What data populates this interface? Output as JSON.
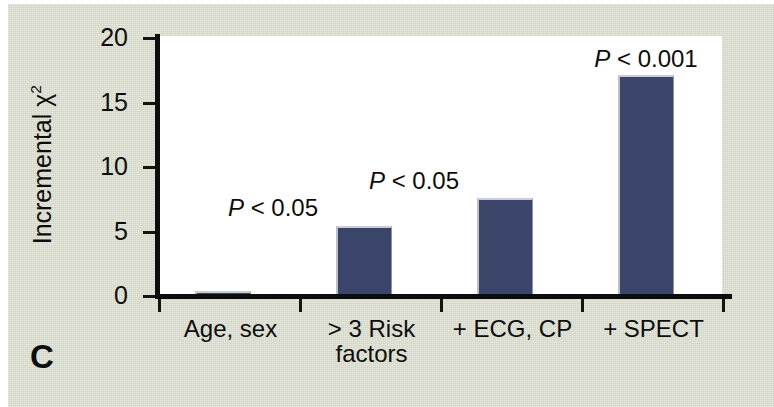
{
  "panel": {
    "label": "C"
  },
  "chart_data": {
    "type": "bar",
    "title": "",
    "xlabel": "",
    "ylabel": "Incremental χ²",
    "ylabel_base": "Incremental χ",
    "ylabel_sup": "2",
    "categories": [
      "Age, sex",
      "> 3 Risk factors",
      "+ ECG, CP",
      "+ SPECT"
    ],
    "category_lines": [
      [
        "Age, sex"
      ],
      [
        "> 3 Risk",
        "factors"
      ],
      [
        "+ ECG, CP"
      ],
      [
        "+ SPECT"
      ]
    ],
    "values": [
      0.35,
      5.4,
      7.5,
      17.0
    ],
    "annotations": [
      "",
      "P < 0.05",
      "P < 0.05",
      "P < 0.001"
    ],
    "annotation_parts": [
      {
        "symbol": "",
        "text": ""
      },
      {
        "symbol": "P",
        "text": " < 0.05"
      },
      {
        "symbol": "P",
        "text": " < 0.05"
      },
      {
        "symbol": "P",
        "text": " < 0.001"
      }
    ],
    "ylim": [
      0,
      20
    ],
    "yticks": [
      0,
      5,
      10,
      15,
      20
    ],
    "ytick_labels": [
      "0",
      "5",
      "10",
      "15",
      "20"
    ],
    "grid": false,
    "legend": null,
    "bar_color": "#3b456a",
    "plot_background": "#ffffff",
    "figure_background": "#d7dbcb",
    "axis_color": "#0d0d0d"
  }
}
